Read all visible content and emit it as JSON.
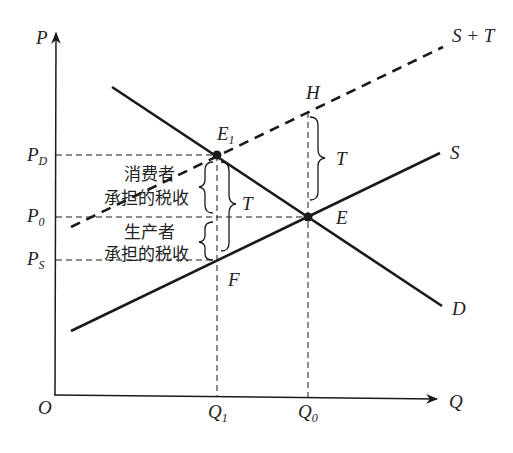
{
  "diagram": {
    "type": "supply-demand-tax-incidence",
    "axes": {
      "y_label": "P",
      "x_label": "Q",
      "origin_label": "O"
    },
    "price_labels": {
      "pd": {
        "main": "P",
        "sub": "D"
      },
      "p0": {
        "main": "P",
        "sub": "0"
      },
      "ps": {
        "main": "P",
        "sub": "S"
      }
    },
    "quantity_labels": {
      "q1": {
        "main": "Q",
        "sub": "1"
      },
      "q0": {
        "main": "Q",
        "sub": "0"
      }
    },
    "curves": {
      "demand": "D",
      "supply": "S",
      "supply_plus_tax": "S + T"
    },
    "points": {
      "e1": {
        "main": "E",
        "sub": "1"
      },
      "e": "E",
      "h": "H",
      "f": "F"
    },
    "braces": {
      "tax_at_q0": "T",
      "tax_at_q1": "T"
    },
    "annotations": {
      "consumer_line1": "消费者",
      "consumer_line2": "承担的税收",
      "producer_line1": "生产者",
      "producer_line2": "承担的税收"
    },
    "colors": {
      "line": "#1a1a1a",
      "text": "#222222",
      "background": "#ffffff"
    }
  }
}
